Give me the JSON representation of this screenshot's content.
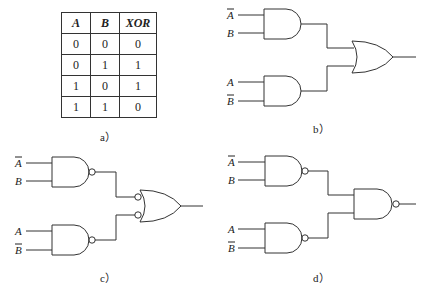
{
  "panels": {
    "a": {
      "caption": "a）",
      "table": {
        "headers": [
          "A",
          "B",
          "XOR"
        ],
        "rows": [
          [
            "0",
            "0",
            "0"
          ],
          [
            "0",
            "1",
            "1"
          ],
          [
            "1",
            "0",
            "1"
          ],
          [
            "1",
            "1",
            "0"
          ]
        ]
      }
    },
    "b": {
      "caption": "b）",
      "description": "Two AND gates feeding an OR gate",
      "inputs_top": [
        "A̅",
        "B"
      ],
      "inputs_bottom": [
        "A",
        "B̅"
      ],
      "first_stage": "AND",
      "second_stage": "OR"
    },
    "c": {
      "caption": "c）",
      "description": "Two NAND gates feeding an OR gate with inverted inputs",
      "inputs_top": [
        "A̅",
        "B"
      ],
      "inputs_bottom": [
        "A",
        "B̅"
      ],
      "first_stage": "NAND",
      "second_stage": "OR with inverted inputs"
    },
    "d": {
      "caption": "d）",
      "description": "Two NAND gates feeding a NAND gate",
      "inputs_top": [
        "A̅",
        "B"
      ],
      "inputs_bottom": [
        "A",
        "B̅"
      ],
      "first_stage": "NAND",
      "second_stage": "NAND"
    }
  }
}
